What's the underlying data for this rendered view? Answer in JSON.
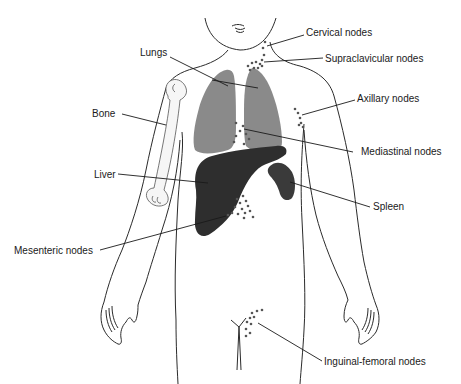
{
  "figure": {
    "colors": {
      "outline": "#2b2b2b",
      "lungs": "#8a8a8a",
      "liver": "#2e2e2e",
      "spleen": "#3a3a3a",
      "nodes": "#555555",
      "bone_fill": "#f4f4f4"
    },
    "labels": [
      {
        "id": "cervical",
        "text": "Cervical nodes"
      },
      {
        "id": "supraclavicular",
        "text": "Supraclavicular nodes"
      },
      {
        "id": "lungs",
        "text": "Lungs"
      },
      {
        "id": "axillary",
        "text": "Axillary nodes"
      },
      {
        "id": "bone",
        "text": "Bone"
      },
      {
        "id": "mediastinal",
        "text": "Mediastinal nodes"
      },
      {
        "id": "liver",
        "text": "Liver"
      },
      {
        "id": "spleen",
        "text": "Spleen"
      },
      {
        "id": "mesenteric",
        "text": "Mesenteric nodes"
      },
      {
        "id": "inguinal",
        "text": "Inguinal-femoral nodes"
      }
    ]
  }
}
